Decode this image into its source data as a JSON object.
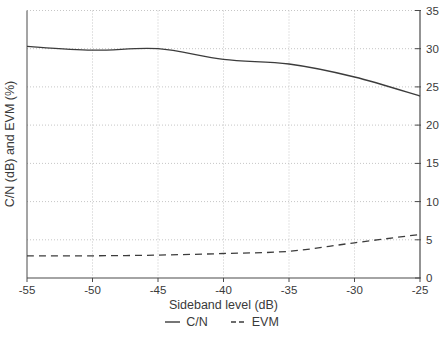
{
  "chart_data": {
    "type": "line",
    "title": "",
    "xlabel": "Sideband level (dB)",
    "ylabel": "C/N (dB) and EVM (%)",
    "x": [
      -55,
      -50,
      -45,
      -40,
      -35,
      -30,
      -25
    ],
    "series": [
      {
        "name": "C/N",
        "style": "solid",
        "values": [
          30.3,
          29.8,
          30.0,
          28.6,
          28.0,
          26.3,
          23.8
        ]
      },
      {
        "name": "EVM",
        "style": "dashed",
        "values": [
          2.9,
          2.9,
          3.0,
          3.2,
          3.5,
          4.6,
          5.7
        ]
      }
    ],
    "xlim": [
      -55,
      -25
    ],
    "ylim": [
      0,
      35
    ],
    "x_ticks": [
      -55,
      -50,
      -45,
      -40,
      -35,
      -30,
      -25
    ],
    "y_ticks": [
      0,
      5,
      10,
      15,
      20,
      25,
      30,
      35
    ],
    "y_axis_side": "right",
    "grid": true,
    "grid_style": "dotted",
    "legend_position": "bottom"
  },
  "legend": {
    "items": [
      {
        "label": "C/N",
        "style": "solid"
      },
      {
        "label": "EVM",
        "style": "dashed"
      }
    ]
  },
  "colors": {
    "line": "#3c3c3c",
    "grid": "#c6c6c6",
    "axis": "#4a4a4a",
    "text": "#3a3a3a",
    "background": "#ffffff"
  }
}
